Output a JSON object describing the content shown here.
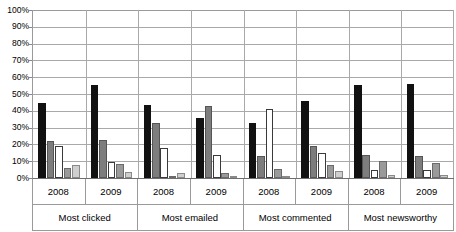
{
  "chart_data": {
    "type": "bar",
    "title": "",
    "subtitle": "",
    "xlabel": "",
    "ylabel": "",
    "ylim": [
      0,
      100
    ],
    "ytick_labels": [
      "100%",
      "90%",
      "80%",
      "70%",
      "60%",
      "50%",
      "40%",
      "30%",
      "20%",
      "10%",
      "0%"
    ],
    "ytick_values": [
      100,
      90,
      80,
      70,
      60,
      50,
      40,
      30,
      20,
      10,
      0
    ],
    "grid": true,
    "legend": "none",
    "grouping": "two-level",
    "group_labels": [
      "Most clicked",
      "Most emailed",
      "Most commented",
      "Most newsworthy"
    ],
    "year_labels": [
      "2008",
      "2009",
      "2008",
      "2009",
      "2008",
      "2009",
      "2008",
      "2009"
    ],
    "categories": [
      "Most clicked 2008",
      "Most clicked 2009",
      "Most emailed 2008",
      "Most emailed 2009",
      "Most commented 2008",
      "Most commented 2009",
      "Most newsworthy 2008",
      "Most newsworthy 2009"
    ],
    "series": [
      {
        "name": "series-1",
        "color": "#111111",
        "values": [
          44.5,
          55.5,
          43.5,
          35.5,
          33.0,
          46.0,
          55.5,
          56.0
        ]
      },
      {
        "name": "series-2",
        "color": "#7d7d7d",
        "values": [
          22.0,
          22.5,
          32.5,
          43.0,
          13.0,
          19.0,
          13.5,
          13.0
        ]
      },
      {
        "name": "series-3",
        "color": "#ffffff",
        "values": [
          19.0,
          9.5,
          18.0,
          13.5,
          41.0,
          15.0,
          5.0,
          4.5
        ]
      },
      {
        "name": "series-4",
        "color": "#9a9a9a",
        "values": [
          6.0,
          8.5,
          0.3,
          3.0,
          5.5,
          7.5,
          10.0,
          9.0
        ]
      },
      {
        "name": "series-5",
        "color": "#cfcfcf",
        "values": [
          7.5,
          3.5,
          3.0,
          0.5,
          0.5,
          4.0,
          2.0,
          2.0
        ]
      }
    ]
  },
  "axis": {
    "y_ticks": [
      {
        "label": "100%",
        "value": 100
      },
      {
        "label": "90%",
        "value": 90
      },
      {
        "label": "80%",
        "value": 80
      },
      {
        "label": "70%",
        "value": 70
      },
      {
        "label": "60%",
        "value": 60
      },
      {
        "label": "50%",
        "value": 50
      },
      {
        "label": "40%",
        "value": 40
      },
      {
        "label": "30%",
        "value": 30
      },
      {
        "label": "20%",
        "value": 20
      },
      {
        "label": "10%",
        "value": 10
      },
      {
        "label": "0%",
        "value": 0
      }
    ]
  },
  "colors": {
    "series_1": "#111111",
    "series_2": "#7d7d7d",
    "series_3": "#ffffff",
    "series_4": "#9a9a9a",
    "series_5": "#cfcfcf",
    "gridline": "#a9a9a9",
    "axis": "#6f6f6f",
    "background": "#ffffff",
    "text": "#000000"
  }
}
